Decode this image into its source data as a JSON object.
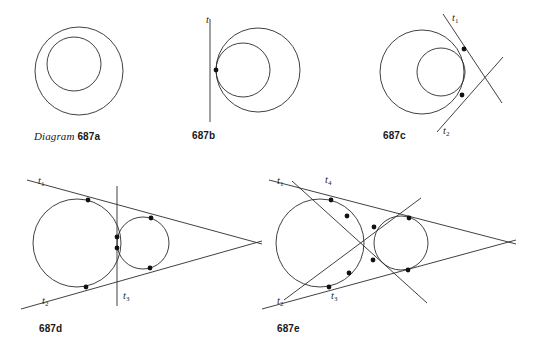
{
  "figure": {
    "background_color": "#ffffff",
    "ink_color": "#2b2b2b",
    "dot_color": "#111111",
    "caption_prefix": "Diagram",
    "panels": [
      {
        "id": "687a",
        "caption": "687a",
        "description": "Two internally tangent-free nested circles, no common tangent lines shown",
        "tangent_labels": []
      },
      {
        "id": "687b",
        "caption": "687b",
        "description": "Two internally tangent circles sharing one common tangent line at the tangency point",
        "tangent_labels": [
          "t"
        ]
      },
      {
        "id": "687c",
        "caption": "687c",
        "description": "Two internally tangent circles with two common tangent lines crossing to the right",
        "tangent_labels": [
          "t",
          "t"
        ],
        "tangent_label_subs": [
          "1",
          "2"
        ]
      },
      {
        "id": "687d",
        "caption": "687d",
        "description": "Two externally tangent circles with two outer common tangents and one inner common tangent",
        "tangent_labels": [
          "t",
          "t",
          "t"
        ],
        "tangent_label_subs": [
          "1",
          "2",
          "3"
        ]
      },
      {
        "id": "687e",
        "caption": "687e",
        "description": "Two separate circles with four common tangent lines, two outer and two inner crossing",
        "tangent_labels": [
          "t",
          "t",
          "t",
          "t"
        ],
        "tangent_label_subs": [
          "1",
          "2",
          "3",
          "4"
        ]
      }
    ]
  },
  "labels": {
    "a": {
      "caption_word": "Diagram",
      "caption_num": "687a"
    },
    "b": {
      "caption_num": "687b",
      "t": "t"
    },
    "c": {
      "caption_num": "687c",
      "t1": "t",
      "t1sub": "1",
      "t2": "t",
      "t2sub": "2"
    },
    "d": {
      "caption_num": "687d",
      "t1": "t",
      "t1sub": "1",
      "t2": "t",
      "t2sub": "2",
      "t3": "t",
      "t3sub": "3"
    },
    "e": {
      "caption_num": "687e",
      "t1": "t",
      "t1sub": "1",
      "t2": "t",
      "t2sub": "2",
      "t3": "t",
      "t3sub": "3",
      "t4": "t",
      "t4sub": "4"
    }
  },
  "geometry": {
    "panel_a": {
      "outer_circle": {
        "cx": 79,
        "cy": 71,
        "r": 44
      },
      "inner_circle": {
        "cx": 74,
        "cy": 64,
        "r": 27
      }
    },
    "panel_b": {
      "outer_circle": {
        "cx": 258,
        "cy": 69,
        "r": 42
      },
      "inner_circle": {
        "cx": 243,
        "cy": 68,
        "r": 27
      },
      "tangent_line": {
        "x1": 210,
        "y1": 18,
        "x2": 210,
        "y2": 122
      },
      "tangency_points": [
        {
          "x": 216,
          "y": 71
        }
      ]
    },
    "panel_c": {
      "outer_circle": {
        "cx": 424,
        "cy": 72,
        "r": 42
      },
      "inner_circle": {
        "cx": 441,
        "cy": 72,
        "r": 25
      },
      "tangent_lines": [
        {
          "x1": 444,
          "y1": 14,
          "x2": 500,
          "y2": 101
        },
        {
          "x1": 440,
          "y1": 130,
          "x2": 500,
          "y2": 58
        }
      ],
      "tangency_points": [
        {
          "x": 464,
          "y": 48
        },
        {
          "x": 464,
          "y": 96
        }
      ]
    },
    "panel_d": {
      "big_circle": {
        "cx": 77,
        "cy": 243,
        "r": 44
      },
      "small_circle": {
        "cx": 142,
        "cy": 243,
        "r": 26
      },
      "tangent_lines": [
        {
          "x1": 27,
          "y1": 180,
          "x2": 260,
          "y2": 243
        },
        {
          "x1": 21,
          "y1": 307,
          "x2": 260,
          "y2": 243
        },
        {
          "x1": 117,
          "y1": 186,
          "x2": 117,
          "y2": 305
        }
      ],
      "tangency_points": [
        {
          "x": 88,
          "y": 200
        },
        {
          "x": 87,
          "y": 287
        },
        {
          "x": 150,
          "y": 218
        },
        {
          "x": 150,
          "y": 268
        },
        {
          "x": 117,
          "y": 238
        },
        {
          "x": 117,
          "y": 248
        }
      ]
    },
    "panel_e": {
      "big_circle": {
        "cx": 320,
        "cy": 243,
        "r": 44
      },
      "small_circle": {
        "cx": 400,
        "cy": 243,
        "r": 27
      },
      "tangent_lines": [
        {
          "x1": 268,
          "y1": 180,
          "x2": 512,
          "y2": 243
        },
        {
          "x1": 262,
          "y1": 307,
          "x2": 512,
          "y2": 243
        },
        {
          "x1": 285,
          "y1": 298,
          "x2": 420,
          "y2": 200
        },
        {
          "x1": 292,
          "y1": 182,
          "x2": 425,
          "y2": 300
        }
      ],
      "tangency_points": [
        {
          "x": 331,
          "y": 200
        },
        {
          "x": 330,
          "y": 287
        },
        {
          "x": 408,
          "y": 218
        },
        {
          "x": 408,
          "y": 270
        },
        {
          "x": 350,
          "y": 254
        },
        {
          "x": 355,
          "y": 228
        },
        {
          "x": 346,
          "y": 217
        },
        {
          "x": 348,
          "y": 273
        }
      ]
    }
  }
}
